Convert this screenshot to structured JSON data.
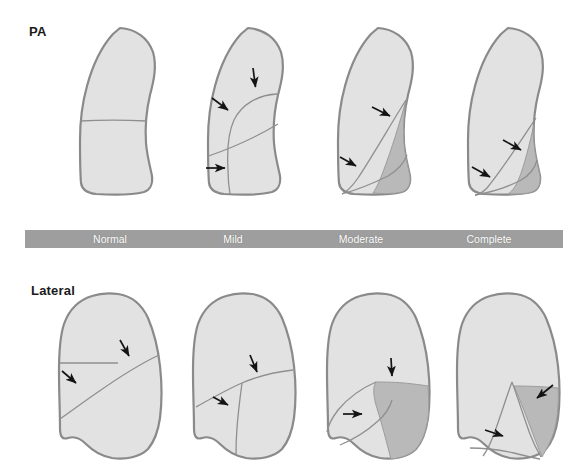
{
  "figure": {
    "title_rows": {
      "pa_label": "PA",
      "lateral_label": "Lateral"
    },
    "severity_scale": {
      "bar_color": "#9e9e9e",
      "label_color": "#ffffff",
      "stages": [
        {
          "label": "Normal",
          "center_x": 110
        },
        {
          "label": "Mild",
          "center_x": 233
        },
        {
          "label": "Moderate",
          "center_x": 361
        },
        {
          "label": "Complete",
          "center_x": 489
        }
      ]
    },
    "colors": {
      "lung_fill": "#e2e2e2",
      "lung_outline": "#8a8a8a",
      "atelectasis_fill": "#b9b9b9",
      "fissure_line": "#8f8f8f",
      "arrow_color": "#141414",
      "background": "#ffffff"
    },
    "pa_panels": [
      {
        "stage": "Normal",
        "arrows": 0,
        "collapse_present": false
      },
      {
        "stage": "Mild",
        "arrows": 3,
        "collapse_present": false
      },
      {
        "stage": "Moderate",
        "arrows": 2,
        "collapse_present": true
      },
      {
        "stage": "Complete",
        "arrows": 2,
        "collapse_present": true
      }
    ],
    "lateral_panels": [
      {
        "stage": "Normal",
        "arrows": 2,
        "collapse_present": false
      },
      {
        "stage": "Mild",
        "arrows": 2,
        "collapse_present": false
      },
      {
        "stage": "Moderate",
        "arrows": 2,
        "collapse_present": true
      },
      {
        "stage": "Complete",
        "arrows": 2,
        "collapse_present": true
      }
    ]
  }
}
